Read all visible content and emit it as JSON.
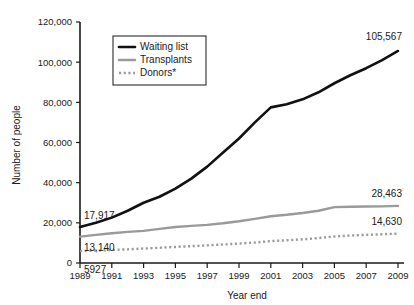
{
  "chart_data": {
    "type": "line",
    "title": "",
    "xlabel": "Year end",
    "ylabel": "Number of people",
    "x": [
      1989,
      1990,
      1991,
      1992,
      1993,
      1994,
      1995,
      1996,
      1997,
      1998,
      1999,
      2000,
      2001,
      2002,
      2003,
      2004,
      2005,
      2006,
      2007,
      2008,
      2009
    ],
    "xlim": [
      1989,
      2009
    ],
    "ylim": [
      0,
      120000
    ],
    "xticks": [
      1989,
      1991,
      1993,
      1995,
      1997,
      1999,
      2001,
      2003,
      2005,
      2007,
      2009
    ],
    "xtick_labels": [
      "1989",
      "1991",
      "1993",
      "1995",
      "1997",
      "1999",
      "2001",
      "2003",
      "2005",
      "2007",
      "2009"
    ],
    "yticks": [
      0,
      20000,
      40000,
      60000,
      80000,
      100000,
      120000
    ],
    "ytick_labels": [
      "0",
      "20,000",
      "40,000",
      "60,000",
      "80,000",
      "100,000",
      "120,000"
    ],
    "grid": false,
    "legend_position": "upper left",
    "series": [
      {
        "name": "Waiting list",
        "style": "solid",
        "color": "#111111",
        "width": 2.6,
        "values": [
          17917,
          19990,
          22603,
          26000,
          30000,
          33000,
          37000,
          42000,
          48000,
          55000,
          62000,
          70000,
          77500,
          79000,
          81500,
          85000,
          89500,
          93500,
          97000,
          101000,
          105567
        ]
      },
      {
        "name": "Transplants",
        "style": "solid",
        "color": "#9a9a9a",
        "width": 2.4,
        "values": [
          13140,
          14000,
          14800,
          15500,
          16000,
          17000,
          17900,
          18500,
          19000,
          19800,
          20800,
          22000,
          23300,
          24000,
          24900,
          26000,
          27800,
          28000,
          28100,
          28200,
          28463
        ]
      },
      {
        "name": "Donors*",
        "style": "dotted",
        "color": "#9a9a9a",
        "width": 2.4,
        "values": [
          5927,
          6200,
          6500,
          6800,
          7200,
          7600,
          8000,
          8400,
          8800,
          9200,
          9700,
          10200,
          10900,
          11300,
          11800,
          12400,
          13200,
          13700,
          14000,
          14300,
          14630
        ]
      }
    ],
    "annotations": [
      {
        "text": "17,917",
        "series": "Waiting list",
        "x": 1989,
        "anchor": "end",
        "dx": 2,
        "dy": -8
      },
      {
        "text": "13,140",
        "series": "Transplants",
        "x": 1989,
        "anchor": "end",
        "dx": 2,
        "dy": 14
      },
      {
        "text": "5927",
        "series": "Donors*",
        "x": 1989,
        "anchor": "end",
        "dx": 0,
        "dy": 22
      },
      {
        "text": "105,567",
        "series": "Waiting list",
        "x": 2009,
        "anchor": "end",
        "dx": 2,
        "dy": -11
      },
      {
        "text": "28,463",
        "series": "Transplants",
        "x": 2009,
        "anchor": "end",
        "dx": 2,
        "dy": -9
      },
      {
        "text": "14,630",
        "series": "Donors*",
        "x": 2009,
        "anchor": "end",
        "dx": 2,
        "dy": -9
      }
    ]
  }
}
